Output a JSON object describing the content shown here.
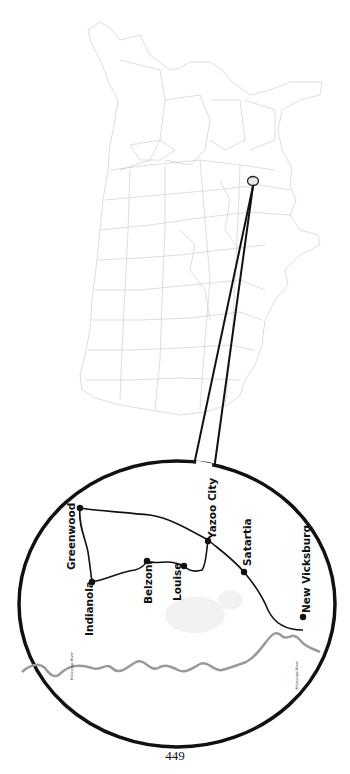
{
  "page": {
    "number": "449"
  },
  "us_map": {
    "description": "Outline map of the contiguous United States rotated 90 degrees with faint state borders",
    "locator_marker": {
      "shape": "circle",
      "cx": 253,
      "cy": 181
    }
  },
  "inset": {
    "shape": "circle",
    "route_color": "#111111",
    "river_color": "#9a9a9a",
    "cities": [
      {
        "name": "Greenwood"
      },
      {
        "name": "Indianola"
      },
      {
        "name": "Belzoni"
      },
      {
        "name": "Louise"
      },
      {
        "name": "Yazoo City"
      },
      {
        "name": "Satartia"
      },
      {
        "name": "New Vicksburg"
      }
    ],
    "rivers": [
      {
        "label": "Mississippi River"
      },
      {
        "label": "Mississippi River"
      }
    ]
  }
}
